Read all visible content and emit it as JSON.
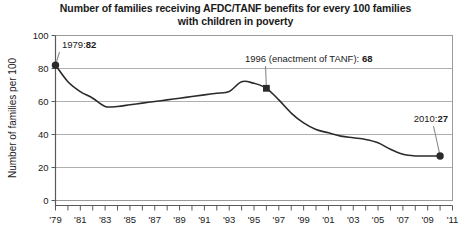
{
  "chart_data": {
    "type": "line",
    "title": "Number of families receiving AFDC/TANF benefits for every 100 families with children in poverty",
    "title_line1": "Number of families receiving AFDC/TANF benefits for every 100 families",
    "title_line2": "with children in poverty",
    "xlabel": "",
    "ylabel": "Number of families per 100",
    "ylim": [
      0,
      100
    ],
    "yticks": [
      0,
      20,
      40,
      60,
      80,
      100
    ],
    "ytick_labels": [
      "0",
      "20",
      "40",
      "60",
      "80",
      "100"
    ],
    "xlim": [
      1979,
      2011
    ],
    "xtick_labels": [
      "'79",
      "'81",
      "'83",
      "'85",
      "'87",
      "'89",
      "'91",
      "'93",
      "'95",
      "'97",
      "'99",
      "'01",
      "'03",
      "'05",
      "'07",
      "'09",
      "'11"
    ],
    "xtick_years": [
      1979,
      1981,
      1983,
      1985,
      1987,
      1989,
      1991,
      1993,
      1995,
      1997,
      1999,
      2001,
      2003,
      2005,
      2007,
      2009,
      2011
    ],
    "grid": true,
    "legend": "none",
    "x": [
      1979,
      1980,
      1981,
      1982,
      1983,
      1984,
      1985,
      1986,
      1987,
      1988,
      1989,
      1990,
      1991,
      1992,
      1993,
      1994,
      1995,
      1996,
      1997,
      1998,
      1999,
      2000,
      2001,
      2002,
      2003,
      2004,
      2005,
      2006,
      2007,
      2008,
      2009,
      2010
    ],
    "values": [
      82,
      72,
      66,
      62,
      57,
      57,
      58,
      59,
      60,
      61,
      62,
      63,
      64,
      65,
      66,
      72,
      71,
      68,
      61,
      53,
      47,
      43,
      41,
      39,
      38,
      37,
      35,
      31,
      28,
      27,
      27,
      27
    ],
    "series_color": "#2b2b2b",
    "grid_color": "#9a9a9a",
    "axis_color": "#5a5a5a",
    "annotations": [
      {
        "id": "anno-1979",
        "label_prefix": "1979:",
        "label_value": "82",
        "year": 1979,
        "value": 82,
        "marker": "circle"
      },
      {
        "id": "anno-1996",
        "label_prefix": "1996 (enactment of TANF): ",
        "label_value": "68",
        "year": 1996,
        "value": 68,
        "marker": "square"
      },
      {
        "id": "anno-2010",
        "label_prefix": "2010:",
        "label_value": "27",
        "year": 2010,
        "value": 27,
        "marker": "circle"
      }
    ]
  }
}
